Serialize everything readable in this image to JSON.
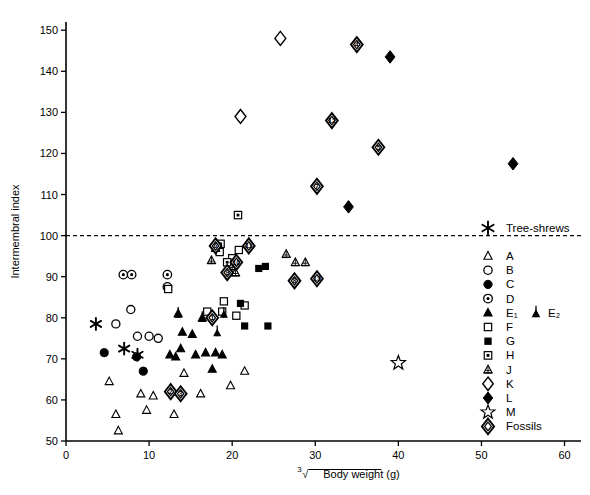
{
  "figure": {
    "title": "",
    "caption": ""
  },
  "axes": {
    "y": {
      "label": "Intermembral index",
      "ticks": [
        50,
        60,
        70,
        80,
        90,
        100,
        110,
        120,
        130,
        140,
        150
      ],
      "min": 50,
      "max": 152
    },
    "x": {
      "label_prefix": "3",
      "label_radical": "√",
      "label_main": "Body weight (g)",
      "label_full": "³√Body weight (g)",
      "ticks": [
        0,
        10,
        20,
        30,
        40,
        50,
        60
      ],
      "min": 0,
      "max": 61.5
    },
    "reference_line": {
      "value": 100,
      "style": "dashed"
    }
  },
  "legend": {
    "top_entry": {
      "symbol": "asterisk",
      "label": "Tree-shrews"
    },
    "items": [
      {
        "symbol": "open-triangle",
        "label": "A"
      },
      {
        "symbol": "open-circle",
        "label": "B"
      },
      {
        "symbol": "filled-circle",
        "label": "C"
      },
      {
        "symbol": "dotted-circle",
        "label": "D"
      },
      {
        "symbol": "filled-triangle",
        "label": "E₁"
      },
      {
        "symbol": "open-square",
        "label": "F"
      },
      {
        "symbol": "filled-square",
        "label": "G"
      },
      {
        "symbol": "dotted-square",
        "label": "H"
      },
      {
        "symbol": "hatched-triangle",
        "label": "J"
      },
      {
        "symbol": "open-diamond",
        "label": "K"
      },
      {
        "symbol": "filled-diamond",
        "label": "L"
      },
      {
        "symbol": "open-star",
        "label": "M"
      },
      {
        "symbol": "fossil-diamond",
        "label": "Fossils"
      }
    ],
    "extra": {
      "symbol": "arrow-triangle",
      "label": "E₂"
    }
  },
  "colors": {
    "ink": "#000000",
    "background": "#ffffff"
  },
  "chart_data": {
    "type": "scatter",
    "title": "",
    "xlabel": "³√Body weight (g)",
    "ylabel": "Intermembral index",
    "xlim": [
      0,
      61.5
    ],
    "ylim": [
      50,
      152
    ],
    "grid": false,
    "legend_position": "right",
    "reference_lines": [
      {
        "axis": "y",
        "value": 100,
        "style": "dashed"
      }
    ],
    "series": [
      {
        "name": "Tree-shrews",
        "symbol": "asterisk",
        "points": [
          [
            3.6,
            78.5
          ],
          [
            7.0,
            72.5
          ],
          [
            8.6,
            71.0
          ]
        ]
      },
      {
        "name": "A",
        "symbol": "open-triangle",
        "points": [
          [
            5.2,
            64.5
          ],
          [
            6.3,
            52.5
          ],
          [
            6.0,
            56.5
          ],
          [
            9.0,
            61.5
          ],
          [
            9.7,
            57.5
          ],
          [
            10.5,
            61.0
          ],
          [
            13.0,
            56.5
          ],
          [
            14.2,
            66.5
          ],
          [
            16.2,
            61.5
          ],
          [
            19.8,
            63.5
          ],
          [
            21.5,
            67.0
          ]
        ]
      },
      {
        "name": "B",
        "symbol": "open-circle",
        "points": [
          [
            6.0,
            78.5
          ],
          [
            7.8,
            82.0
          ],
          [
            8.6,
            75.5
          ],
          [
            10.0,
            75.5
          ],
          [
            11.1,
            75.0
          ]
        ]
      },
      {
        "name": "C",
        "symbol": "filled-circle",
        "points": [
          [
            4.6,
            71.5
          ],
          [
            8.5,
            70.5
          ],
          [
            9.3,
            67.0
          ]
        ]
      },
      {
        "name": "D",
        "symbol": "dotted-circle",
        "points": [
          [
            6.9,
            90.5
          ],
          [
            7.9,
            90.5
          ],
          [
            12.2,
            90.5
          ],
          [
            12.2,
            87.5
          ]
        ]
      },
      {
        "name": "E1",
        "symbol": "filled-triangle",
        "points": [
          [
            12.5,
            71.0
          ],
          [
            13.2,
            70.5
          ],
          [
            13.8,
            72.5
          ],
          [
            14.0,
            76.5
          ],
          [
            15.2,
            76.0
          ],
          [
            15.6,
            71.0
          ],
          [
            16.8,
            71.5
          ],
          [
            17.6,
            67.5
          ],
          [
            18.0,
            71.5
          ],
          [
            18.8,
            71.0
          ],
          [
            13.5,
            81.0
          ],
          [
            16.4,
            80.0
          ]
        ]
      },
      {
        "name": "E2",
        "symbol": "arrow-triangle",
        "points": [
          [
            13.5,
            81.0
          ],
          [
            16.4,
            80.0
          ],
          [
            18.2,
            76.5
          ],
          [
            19.0,
            81.0
          ]
        ]
      },
      {
        "name": "F",
        "symbol": "open-square",
        "points": [
          [
            12.3,
            87.0
          ],
          [
            17.0,
            81.5
          ],
          [
            18.8,
            81.5
          ],
          [
            20.5,
            80.5
          ],
          [
            19.0,
            84.0
          ],
          [
            21.5,
            83.0
          ],
          [
            20.0,
            94.5
          ],
          [
            20.8,
            96.5
          ],
          [
            18.5,
            96.0
          ]
        ]
      },
      {
        "name": "G",
        "symbol": "filled-square",
        "points": [
          [
            21.0,
            83.5
          ],
          [
            21.5,
            78.0
          ],
          [
            24.3,
            78.0
          ],
          [
            23.2,
            92.0
          ],
          [
            24.0,
            92.5
          ]
        ]
      },
      {
        "name": "H",
        "symbol": "dotted-square",
        "points": [
          [
            18.6,
            98.0
          ],
          [
            20.7,
            105.0
          ],
          [
            19.4,
            93.5
          ]
        ]
      },
      {
        "name": "J",
        "symbol": "hatched-triangle",
        "points": [
          [
            18.0,
            97.0
          ],
          [
            19.6,
            91.5
          ],
          [
            20.0,
            92.5
          ],
          [
            20.4,
            91.0
          ],
          [
            26.5,
            95.5
          ],
          [
            27.6,
            93.5
          ],
          [
            28.8,
            93.5
          ],
          [
            17.5,
            94.0
          ]
        ]
      },
      {
        "name": "K",
        "symbol": "open-diamond",
        "points": [
          [
            21.0,
            129.0
          ],
          [
            25.8,
            148.0
          ]
        ]
      },
      {
        "name": "L",
        "symbol": "filled-diamond",
        "points": [
          [
            34.0,
            107.0
          ],
          [
            39.0,
            143.5
          ],
          [
            53.8,
            117.5
          ]
        ]
      },
      {
        "name": "M",
        "symbol": "open-star",
        "points": [
          [
            40.0,
            69.0
          ]
        ]
      },
      {
        "name": "Fossils",
        "symbol": "fossil-diamond",
        "points": [
          [
            17.6,
            80.0
          ],
          [
            12.6,
            62.0
          ],
          [
            13.8,
            61.5
          ],
          [
            35.0,
            146.5
          ],
          [
            37.6,
            121.5
          ],
          [
            18.0,
            97.5
          ],
          [
            30.2,
            112.0
          ],
          [
            27.5,
            89.0
          ],
          [
            19.4,
            91.0
          ],
          [
            20.5,
            93.5
          ],
          [
            22.0,
            97.5
          ],
          [
            32.0,
            128.0
          ],
          [
            30.2,
            89.5
          ]
        ],
        "labels": [
          "1",
          "2",
          "3",
          "4",
          "5",
          "6",
          "7",
          "8",
          "9",
          "10",
          "11",
          "12",
          "13"
        ]
      }
    ]
  }
}
